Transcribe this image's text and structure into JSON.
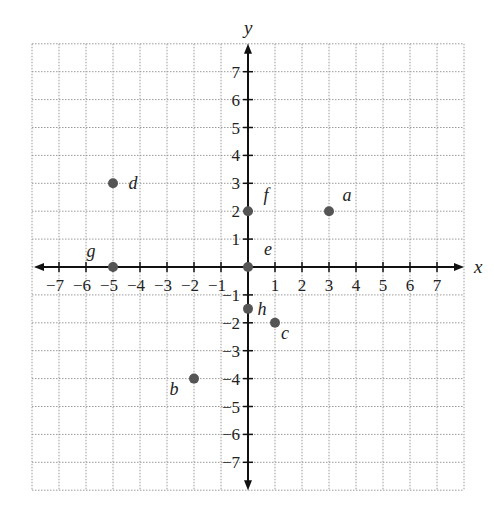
{
  "chart_data": {
    "type": "scatter",
    "title": "",
    "xlabel": "x",
    "ylabel": "y",
    "xlim": [
      -8,
      8
    ],
    "ylim": [
      -8,
      8
    ],
    "grid": true,
    "grid_style": "dotted",
    "x_ticks": [
      -7,
      -6,
      -5,
      -4,
      -3,
      -2,
      -1,
      1,
      2,
      3,
      4,
      5,
      6,
      7
    ],
    "y_ticks": [
      -7,
      -6,
      -5,
      -4,
      -3,
      -2,
      -1,
      1,
      2,
      3,
      4,
      5,
      6,
      7
    ],
    "points": [
      {
        "label": "a",
        "x": 3,
        "y": 2,
        "label_dx": 18,
        "label_dy": -10
      },
      {
        "label": "b",
        "x": -2,
        "y": -4,
        "label_dx": -20,
        "label_dy": 16
      },
      {
        "label": "c",
        "x": 1,
        "y": -2,
        "label_dx": 10,
        "label_dy": 16
      },
      {
        "label": "d",
        "x": -5,
        "y": 3,
        "label_dx": 20,
        "label_dy": 6
      },
      {
        "label": "e",
        "x": 0,
        "y": 0,
        "label_dx": 20,
        "label_dy": -12
      },
      {
        "label": "f",
        "x": 0,
        "y": 2,
        "label_dx": 18,
        "label_dy": -10
      },
      {
        "label": "g",
        "x": -5,
        "y": 0,
        "label_dx": -22,
        "label_dy": -10
      },
      {
        "label": "h",
        "x": 0,
        "y": -1.5,
        "label_dx": 14,
        "label_dy": 6
      }
    ]
  },
  "colors": {
    "axis": "#111111",
    "grid": "#9a9a9a",
    "point": "#555555",
    "text": "#222222"
  },
  "layout": {
    "x0": 248,
    "y0": 267,
    "ux": 27,
    "uy": 27.9
  }
}
